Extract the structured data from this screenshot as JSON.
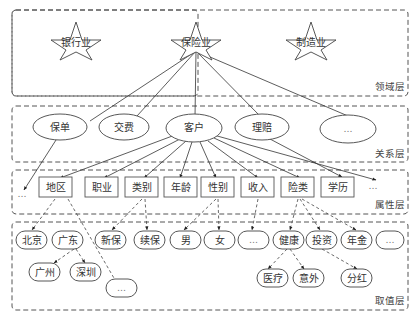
{
  "layers": {
    "domain": "领域层",
    "relation": "关系层",
    "attribute": "属性层",
    "value": "取值层"
  },
  "domain_nodes": [
    "银行业",
    "保险业",
    "制造业"
  ],
  "relation_nodes": [
    "保单",
    "交费",
    "客户",
    "理赔",
    "…"
  ],
  "attribute_nodes": [
    "…",
    "地区",
    "职业",
    "类别",
    "年龄",
    "性别",
    "收入",
    "险类",
    "学历",
    "…"
  ],
  "value_nodes": {
    "row1": [
      "北京",
      "广东",
      "新保",
      "续保",
      "男",
      "女",
      "…",
      "健康",
      "投资",
      "年金",
      "…"
    ],
    "row2": [
      "广州",
      "深圳",
      "医疗",
      "意外",
      "分红"
    ],
    "row3": [
      "…"
    ]
  }
}
